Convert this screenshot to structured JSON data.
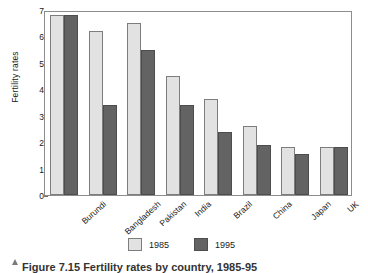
{
  "chart_data": {
    "type": "bar",
    "title": "",
    "xlabel": "",
    "ylabel": "Fertility rates",
    "ylim": [
      0,
      7
    ],
    "yticks": [
      "0",
      "1",
      "2",
      "3",
      "4",
      "5",
      "6",
      "7"
    ],
    "grid": false,
    "legend_position": "bottom-center",
    "categories": [
      "Burundi",
      "Bangladesh",
      "Pakistan",
      "India",
      "Brazil",
      "China",
      "Japan",
      "UK"
    ],
    "series": [
      {
        "name": "1985",
        "color": "#e2e2e2",
        "values": [
          6.8,
          6.2,
          6.5,
          4.5,
          3.65,
          2.6,
          1.8,
          1.8
        ]
      },
      {
        "name": "1995",
        "color": "#636363",
        "values": [
          6.8,
          3.4,
          5.5,
          3.4,
          2.4,
          1.9,
          1.55,
          1.8
        ]
      }
    ]
  },
  "legend": {
    "entries": [
      {
        "label": "1985"
      },
      {
        "label": "1995"
      }
    ]
  },
  "caption": {
    "text": "Figure 7.15 Fertility rates by country, 1985-95"
  }
}
